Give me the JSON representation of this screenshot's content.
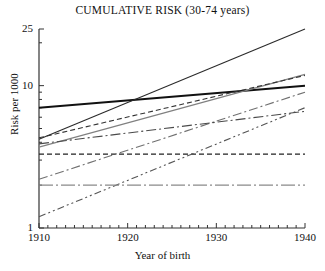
{
  "chart_data": {
    "type": "line",
    "title": "CUMULATIVE RISK (30-74 years)",
    "xlabel": "Year of birth",
    "ylabel": "Risk per 1000",
    "xlim": [
      1910,
      1940
    ],
    "ylim": [
      1,
      25
    ],
    "yscale": "log",
    "xscale": "linear",
    "grid": false,
    "legend": "none",
    "xticks": [
      1910,
      1911,
      1912,
      1913,
      1914,
      1915,
      1916,
      1917,
      1918,
      1919,
      1920,
      1921,
      1922,
      1923,
      1924,
      1925,
      1926,
      1927,
      1928,
      1929,
      1930,
      1931,
      1932,
      1933,
      1934,
      1935,
      1936,
      1937,
      1938,
      1939,
      1940
    ],
    "xtick_labels": [
      "1910",
      "1920",
      "1930",
      "1940"
    ],
    "xtick_label_values": [
      1910,
      1920,
      1930,
      1940
    ],
    "ytick_labels": [
      "25",
      "10",
      "1"
    ],
    "ytick_label_values": [
      25,
      10,
      1
    ],
    "yticks_minor": [
      2,
      3,
      4,
      5,
      6,
      7,
      8,
      9,
      20
    ],
    "x": [
      1910,
      1940
    ],
    "series": [
      {
        "name": "series-1",
        "style": "solid-thick-black",
        "color": "#111111",
        "width": 2.0,
        "dash": "none",
        "values": [
          7.0,
          10.0
        ]
      },
      {
        "name": "series-2",
        "style": "solid-steep-black",
        "color": "#2a2a2a",
        "width": 1.1,
        "dash": "none",
        "values": [
          4.2,
          25.0
        ]
      },
      {
        "name": "series-3",
        "style": "solid-gray",
        "color": "#808080",
        "width": 1.1,
        "dash": "none",
        "values": [
          3.7,
          12.0
        ]
      },
      {
        "name": "series-4",
        "style": "dashed-black",
        "color": "#333333",
        "width": 1.1,
        "dash": "5,3",
        "values": [
          4.3,
          11.8
        ]
      },
      {
        "name": "series-5",
        "style": "dashed-horizontal-black",
        "color": "#222222",
        "width": 1.2,
        "dash": "5,3",
        "values": [
          3.3,
          3.3
        ]
      },
      {
        "name": "series-6",
        "style": "dashdot-gray-rising",
        "color": "#707070",
        "width": 1.1,
        "dash": "9,3,2,3",
        "values": [
          2.2,
          9.0
        ]
      },
      {
        "name": "series-7",
        "style": "dashdotdot-steep",
        "color": "#555555",
        "width": 1.1,
        "dash": "7,3,2,3,2,3",
        "values": [
          1.2,
          7.0
        ]
      },
      {
        "name": "series-8",
        "style": "dashdot-horizontal-gray",
        "color": "#8a8a8a",
        "width": 1.4,
        "dash": "14,3,2,3",
        "values": [
          2.0,
          2.0
        ]
      },
      {
        "name": "series-9",
        "style": "dashdot-dark-rising",
        "color": "#4a4a4a",
        "width": 1.1,
        "dash": "10,3,2,3",
        "values": [
          3.9,
          6.6
        ]
      }
    ]
  },
  "axes": {
    "plot_left_px": 39,
    "plot_right_px": 305,
    "plot_top_px": 29,
    "plot_bottom_px": 228
  }
}
